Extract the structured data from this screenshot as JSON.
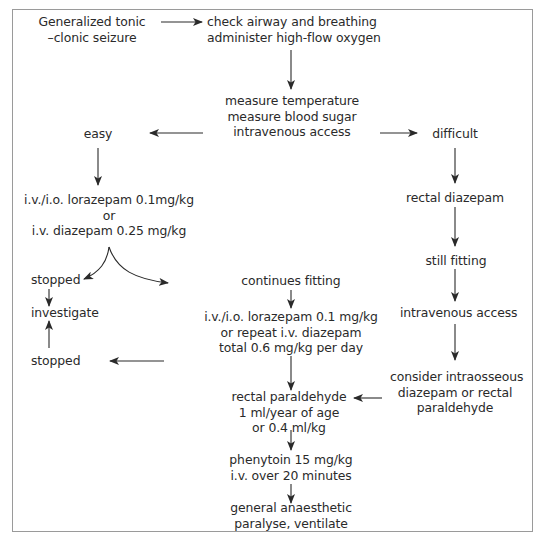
{
  "diagram": {
    "nodes": {
      "seizure": [
        "Generalized tonic",
        "–clonic seizure"
      ],
      "airway": [
        "check airway and breathing",
        "administer high-flow oxygen"
      ],
      "measure": [
        "measure temperature",
        "measure blood sugar",
        "intravenous access"
      ],
      "easy": [
        "easy"
      ],
      "difficult": [
        "difficult"
      ],
      "first_line": [
        "i.v./i.o. lorazepam 0.1mg/kg",
        "or",
        "i.v. diazepam 0.25 mg/kg"
      ],
      "rectal_diazepam": [
        "rectal diazepam"
      ],
      "stopped_1": [
        "stopped"
      ],
      "continues": [
        "continues fitting"
      ],
      "still_fitting": [
        "still fitting"
      ],
      "investigate": [
        "investigate"
      ],
      "second_line": [
        "i.v./i.o. lorazepam 0.1 mg/kg",
        "or repeat i.v. diazepam",
        "total 0.6 mg/kg per day"
      ],
      "iv_access": [
        "intravenous access"
      ],
      "stopped_2": [
        "stopped"
      ],
      "paraldehyde": [
        "rectal paraldehyde",
        "1 ml/year of age",
        "or 0.4 ml/kg"
      ],
      "intraosseous": [
        "consider intraosseous",
        "diazepam or rectal",
        "paraldehyde"
      ],
      "phenytoin": [
        "phenytoin 15 mg/kg",
        "i.v. over 20 minutes"
      ],
      "anaesthetic": [
        "general anaesthetic",
        "paralyse, ventilate"
      ]
    },
    "edges": [
      {
        "from": "seizure",
        "to": "airway"
      },
      {
        "from": "airway",
        "to": "measure"
      },
      {
        "from": "measure",
        "to": "easy"
      },
      {
        "from": "measure",
        "to": "difficult"
      },
      {
        "from": "easy",
        "to": "first_line"
      },
      {
        "from": "difficult",
        "to": "rectal_diazepam"
      },
      {
        "from": "first_line",
        "to": "stopped_1"
      },
      {
        "from": "first_line",
        "to": "continues"
      },
      {
        "from": "rectal_diazepam",
        "to": "still_fitting"
      },
      {
        "from": "stopped_1",
        "to": "investigate"
      },
      {
        "from": "continues",
        "to": "second_line"
      },
      {
        "from": "still_fitting",
        "to": "iv_access"
      },
      {
        "from": "stopped_2",
        "to": "investigate"
      },
      {
        "from": "second_line",
        "to": "stopped_2"
      },
      {
        "from": "second_line",
        "to": "paraldehyde"
      },
      {
        "from": "iv_access",
        "to": "intraosseous"
      },
      {
        "from": "intraosseous",
        "to": "paraldehyde"
      },
      {
        "from": "paraldehyde",
        "to": "phenytoin"
      },
      {
        "from": "phenytoin",
        "to": "anaesthetic"
      }
    ],
    "colors": {
      "text": "#2a2a2a",
      "arrow": "#2a2a2a",
      "border": "#9a9a9a",
      "background": "#ffffff"
    }
  }
}
